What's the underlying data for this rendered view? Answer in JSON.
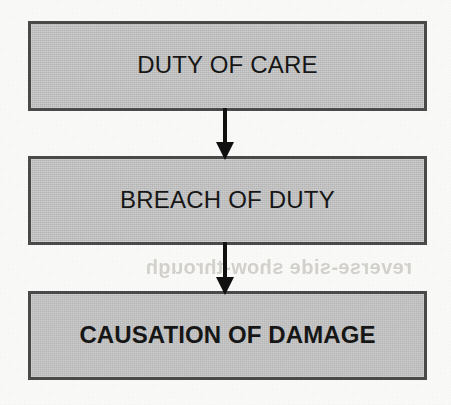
{
  "diagram": {
    "type": "flowchart",
    "orientation": "vertical-top-to-bottom",
    "title_visible": false,
    "background_color": "#fbfbf9",
    "node_fill_color": "#c2c2c2",
    "node_border_color": "#4b4b4b",
    "text_color": "#171717",
    "arrow_color": "#111111",
    "nodes": [
      {
        "id": "duty-of-care",
        "label": "DUTY OF CARE",
        "order": 1,
        "font_weight": "regular",
        "shape": "rectangle"
      },
      {
        "id": "breach-of-duty",
        "label": "BREACH OF DUTY",
        "order": 2,
        "font_weight": "regular",
        "shape": "rectangle"
      },
      {
        "id": "causation-of-damage",
        "label": "CAUSATION OF DAMAGE",
        "order": 3,
        "font_weight": "bold",
        "shape": "rectangle"
      }
    ],
    "edges": [
      {
        "id": "duty-to-breach",
        "from": "duty-of-care",
        "to": "breach-of-duty",
        "label": "",
        "arrowhead": "filled-triangle",
        "direction": "down"
      },
      {
        "id": "breach-to-causation",
        "from": "breach-of-duty",
        "to": "causation-of-damage",
        "label": "",
        "arrowhead": "filled-triangle",
        "direction": "down"
      }
    ],
    "artifacts": {
      "bleed_through_text": "reverse-side show-through",
      "bleed_through_legible": false
    }
  }
}
